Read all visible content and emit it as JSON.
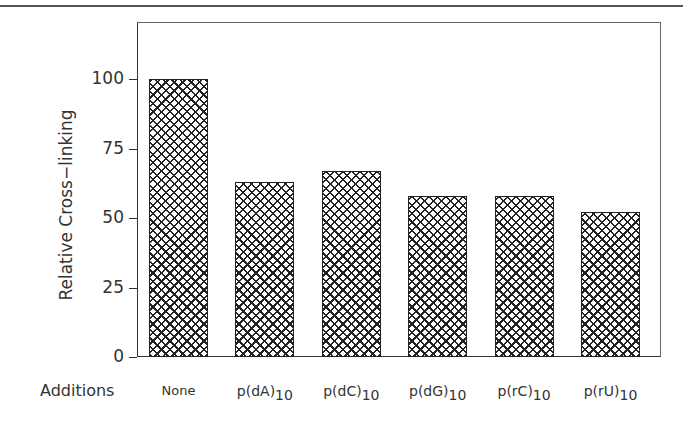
{
  "chart_data": {
    "type": "bar",
    "title": "",
    "xlabel": "Additions",
    "ylabel": "Relative Cross−linking",
    "categories": [
      "None",
      "p(dA)10",
      "p(dC)10",
      "p(dG)10",
      "p(rC)10",
      "p(rU)10"
    ],
    "category_labels": [
      {
        "base": "None",
        "sub": ""
      },
      {
        "base": "p(dA)",
        "sub": "10"
      },
      {
        "base": "p(dC)",
        "sub": "10"
      },
      {
        "base": "p(dG)",
        "sub": "10"
      },
      {
        "base": "p(rC)",
        "sub": "10"
      },
      {
        "base": "p(rU)",
        "sub": "10"
      }
    ],
    "values": [
      100,
      63,
      67,
      58,
      58,
      52
    ],
    "ylim": [
      0,
      120
    ],
    "yticks": [
      0,
      25,
      50,
      75,
      100
    ],
    "ytick_labels": [
      "0",
      "25",
      "50",
      "75",
      "100"
    ],
    "grid": false,
    "legend": null,
    "bar_fill": "crosshatch",
    "bar_color": "#222222"
  }
}
